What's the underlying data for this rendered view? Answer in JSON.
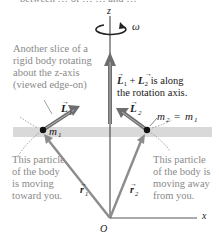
{
  "top_cutoff_text": "between … of … … and …",
  "axes": {
    "z_label": "z",
    "x_label": "x",
    "origin_label": "O",
    "omega_label": "ω"
  },
  "captions": {
    "slice": [
      "Another slice of a",
      "rigid body rotating",
      "about the z-axis",
      "(viewed edge-on)"
    ],
    "sum": [
      "L⃗₁ + L⃗₂ is along",
      "the rotation axis."
    ],
    "toward": [
      "This particle",
      "of the body",
      "is moving",
      "toward you."
    ],
    "away": [
      "This particle",
      "of the body is",
      "moving away",
      "from you."
    ]
  },
  "vectors": {
    "L1": "L",
    "L1_sub": "1",
    "L2": "L",
    "L2_sub": "2",
    "r1": "r",
    "r1_sub": "1",
    "r2": "r",
    "r2_sub": "2",
    "sum_L": "L",
    "sum_plus": "+",
    "sum_rest": "is along",
    "sum_line2": "the rotation axis."
  },
  "masses": {
    "m1": "m",
    "m1_sub": "1",
    "m2_eq": "m",
    "m2_sub": "2",
    "eq": "=",
    "m1_rhs": "m",
    "m1_rhs_sub": "1"
  },
  "colors": {
    "band": "#d9d9d9",
    "vector_gray": "#8c8c8c",
    "vector_dark": "#4a4a4a",
    "axis": "#333333",
    "caption": "#8a8a8a"
  }
}
